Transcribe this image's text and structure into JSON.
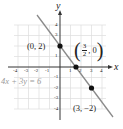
{
  "graph": {
    "equation": "4x + 3y = 6",
    "axis_labels": {
      "x": "x",
      "y": "y"
    },
    "x_ticks": [
      "-4",
      "-3",
      "-2",
      "-1",
      "1",
      "2",
      "3",
      "4"
    ],
    "y_ticks": [
      "4",
      "3",
      "2",
      "1",
      "-1",
      "-2",
      "-3",
      "-4"
    ],
    "points": [
      {
        "label": "(0, 2)",
        "x": 0,
        "y": 2
      },
      {
        "label_num": "3",
        "label_den": "2",
        "label_rest": ", 0",
        "x": 1.5,
        "y": 0
      },
      {
        "label": "(3, −2)",
        "x": 3,
        "y": -2
      }
    ],
    "colors": {
      "line": "#7f7f7f",
      "axis": "#333333",
      "grid": "#d9d9d9",
      "point": "#111111",
      "equation": "#9a9a9a"
    }
  }
}
